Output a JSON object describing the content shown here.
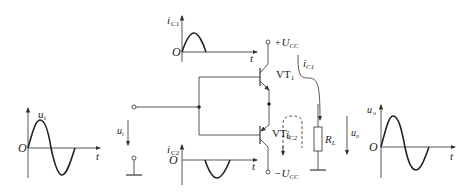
{
  "diagram": {
    "type": "circuit",
    "input_waveform": {
      "ylabel": "u",
      "ysub": "i",
      "origin": "O",
      "xlabel": "t",
      "shape": "full sine"
    },
    "ic1_waveform": {
      "ylabel": "i",
      "ysub": "C1",
      "origin": "O",
      "xlabel": "t",
      "shape": "positive half-wave"
    },
    "ic2_waveform": {
      "ylabel": "i",
      "ysub": "C2",
      "origin": "O",
      "xlabel": "t",
      "shape": "negative half-wave"
    },
    "output_waveform": {
      "ylabel": "u",
      "ysub": "o",
      "origin": "O",
      "xlabel": "t",
      "shape": "full sine"
    },
    "components": {
      "vt1": {
        "label": "VT",
        "sub": "1"
      },
      "vt2": {
        "label": "VT",
        "sub": "2"
      },
      "load": {
        "label": "R",
        "sub": "L"
      },
      "vcc_pos": {
        "prefix": "+U",
        "sub": "CC"
      },
      "vcc_neg": {
        "prefix": "−U",
        "sub": "CC"
      }
    },
    "labels": {
      "input_voltage": {
        "main": "u",
        "sub": "i"
      },
      "output_voltage": {
        "main": "u",
        "sub": "o"
      },
      "current_ic1": {
        "main": "i",
        "sub": "C1"
      },
      "current_ic2": {
        "main": "i",
        "sub": "C2"
      }
    }
  }
}
